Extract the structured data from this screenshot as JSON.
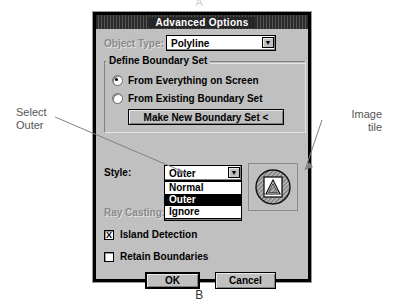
{
  "figure": {
    "label_top": "A",
    "label_bottom": "B"
  },
  "callouts": {
    "left": {
      "line1": "Select",
      "line2": "Outer"
    },
    "right": {
      "line1": "Image",
      "line2": "tile"
    }
  },
  "dialog": {
    "title": "Advanced Options",
    "object_type": {
      "label": "Object Type:",
      "value": "Polyline",
      "disabled": true
    },
    "boundary_group": {
      "title": "Define Boundary Set",
      "radios": [
        {
          "label": "From Everything on Screen",
          "selected": true
        },
        {
          "label": "From Existing Boundary Set",
          "selected": false
        }
      ],
      "make_set_button": "Make New Boundary Set <"
    },
    "style": {
      "label": "Style:",
      "value": "Outer",
      "options": [
        "Normal",
        "Outer",
        "Ignore"
      ],
      "selected_option": "Outer",
      "open": true
    },
    "ray_casting": {
      "label": "Ray Casting:",
      "value": "Ignore",
      "disabled": true
    },
    "checkboxes": [
      {
        "label": "Island Detection",
        "checked": true,
        "mark": "X"
      },
      {
        "label": "Retain Boundaries",
        "checked": false,
        "mark": ""
      }
    ],
    "buttons": {
      "ok": "OK",
      "cancel": "Cancel"
    },
    "image_tile_icon": "hatched-circle-with-triangle-icon"
  },
  "colors": {
    "dialog_face": "#c0c0c0",
    "titlebar": "#262626",
    "highlight": "#000000",
    "field": "#ffffff",
    "disabled_text": "#8a8a8a"
  }
}
